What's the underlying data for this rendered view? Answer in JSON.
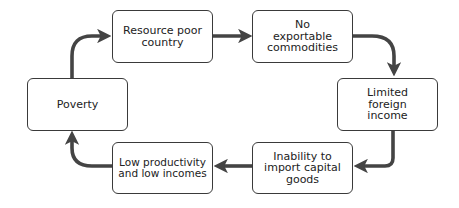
{
  "diagram": {
    "type": "cycle",
    "nodes": [
      {
        "id": "resource",
        "label": "Resource poor country"
      },
      {
        "id": "noexport",
        "label": "No exportable commodities"
      },
      {
        "id": "limited",
        "label": "Limited foreign income"
      },
      {
        "id": "inability",
        "label": "Inability to import capital goods"
      },
      {
        "id": "lowprod",
        "label": "Low productivity and low incomes"
      },
      {
        "id": "poverty",
        "label": "Poverty"
      }
    ],
    "edges": [
      [
        "resource",
        "noexport"
      ],
      [
        "noexport",
        "limited"
      ],
      [
        "limited",
        "inability"
      ],
      [
        "inability",
        "lowprod"
      ],
      [
        "lowprod",
        "poverty"
      ],
      [
        "poverty",
        "resource"
      ]
    ]
  }
}
